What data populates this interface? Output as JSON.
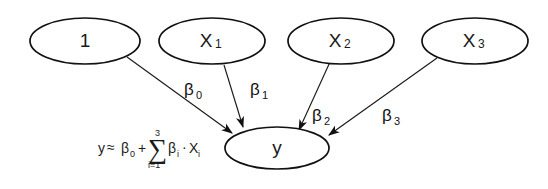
{
  "diagram": {
    "title_text": "",
    "type": "directed-graph",
    "background_color": "#ffffff",
    "stroke_color": "#1a1a1a",
    "nodes": [
      {
        "id": "const",
        "label": "1",
        "sub": "",
        "cx": 85,
        "cy": 41,
        "rx": 55,
        "ry": 23
      },
      {
        "id": "x1",
        "label": "X",
        "sub": "1",
        "cx": 212,
        "cy": 41,
        "rx": 53,
        "ry": 23
      },
      {
        "id": "x2",
        "label": "X",
        "sub": "2",
        "cx": 341,
        "cy": 41,
        "rx": 53,
        "ry": 23
      },
      {
        "id": "x3",
        "label": "X",
        "sub": "3",
        "cx": 475,
        "cy": 41,
        "rx": 53,
        "ry": 23
      },
      {
        "id": "y",
        "label": "y",
        "sub": "",
        "cx": 277,
        "cy": 148,
        "rx": 52,
        "ry": 21
      }
    ],
    "edges": [
      {
        "id": "e0",
        "from": "const",
        "to": "y",
        "label": "β",
        "sub": "0",
        "label_x": 187,
        "label_y": 89
      },
      {
        "id": "e1",
        "from": "x1",
        "to": "y",
        "label": "β",
        "sub": "1",
        "label_x": 250,
        "label_y": 89
      },
      {
        "id": "e2",
        "from": "x2",
        "to": "y",
        "label": "β",
        "sub": "2",
        "label_x": 314,
        "label_y": 115
      },
      {
        "id": "e3",
        "from": "x3",
        "to": "y",
        "label": "β",
        "sub": "3",
        "label_x": 384,
        "label_y": 115
      }
    ],
    "formula": {
      "lhs": "y",
      "relation": "≈",
      "intercept": "β",
      "intercept_sub": "0",
      "plus": "+",
      "sigma": "∑",
      "sigma_upper": "3",
      "sigma_lower": "i=1",
      "term_beta": "β",
      "term_beta_sub": "i",
      "dot": "·",
      "term_x": "X",
      "term_x_sub": "i",
      "full_text": "y ≈ β₀ + ∑(i=1..3) βᵢ · Xᵢ"
    }
  }
}
